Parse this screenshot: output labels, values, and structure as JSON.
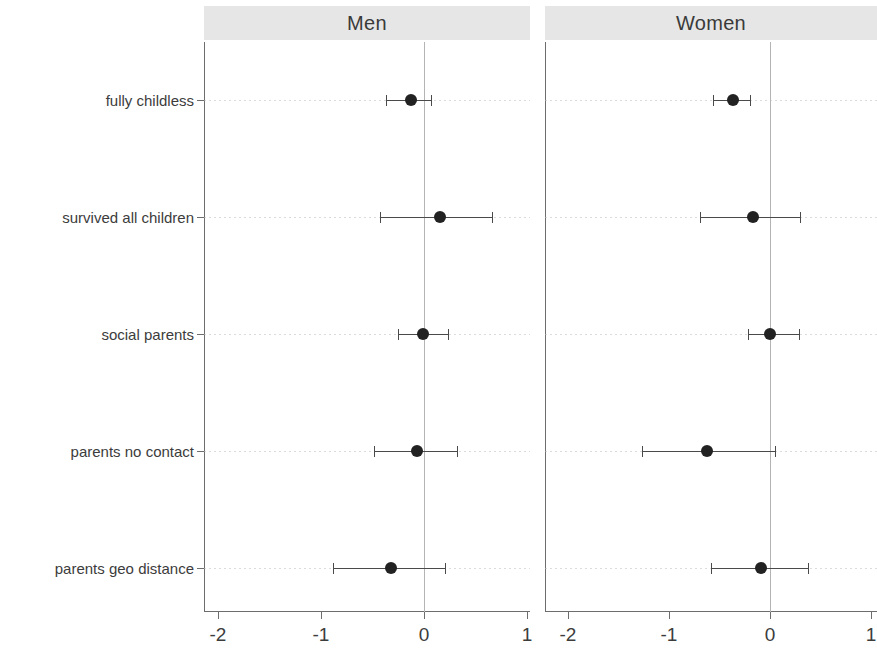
{
  "figure": {
    "width": 877,
    "height": 660,
    "background": "#ffffff",
    "strip_background": "#e6e6e6",
    "point_color": "#222222",
    "line_color": "#4a4a4a",
    "axis_color": "#6d6d6d",
    "zeroline_color": "#b4b4b4"
  },
  "chart_data": {
    "type": "scatter",
    "subtype": "forest-plot",
    "title": "",
    "subtitle": "",
    "xlabel": "",
    "ylabel": "",
    "xlim": [
      -2.3,
      1.15
    ],
    "xticks": [
      -2,
      -1,
      0,
      1
    ],
    "xticklabels": [
      "-2",
      "-1",
      "0",
      "1"
    ],
    "grid": false,
    "legend": "none",
    "reference_line": 0,
    "categories": [
      "fully childless",
      "survived all children",
      "social parents",
      "parents no contact",
      "parents geo distance"
    ],
    "panels": [
      {
        "name": "Men",
        "label": "Men",
        "points": [
          {
            "category": "fully childless",
            "estimate": -0.13,
            "ci_low": -0.37,
            "ci_high": 0.07
          },
          {
            "category": "survived all children",
            "estimate": 0.16,
            "ci_low": -0.43,
            "ci_high": 0.66
          },
          {
            "category": "social parents",
            "estimate": -0.01,
            "ci_low": -0.25,
            "ci_high": 0.23
          },
          {
            "category": "parents no contact",
            "estimate": -0.07,
            "ci_low": -0.49,
            "ci_high": 0.32
          },
          {
            "category": "parents geo distance",
            "estimate": -0.32,
            "ci_low": -0.88,
            "ci_high": 0.2
          }
        ]
      },
      {
        "name": "Women",
        "label": "Women",
        "points": [
          {
            "category": "fully childless",
            "estimate": -0.37,
            "ci_low": -0.56,
            "ci_high": -0.2
          },
          {
            "category": "survived all children",
            "estimate": -0.17,
            "ci_low": -0.69,
            "ci_high": 0.3
          },
          {
            "category": "social parents",
            "estimate": 0.0,
            "ci_low": -0.22,
            "ci_high": 0.29
          },
          {
            "category": "parents no contact",
            "estimate": -0.62,
            "ci_low": -1.27,
            "ci_high": 0.05
          },
          {
            "category": "parents geo distance",
            "estimate": -0.09,
            "ci_low": -0.58,
            "ci_high": 0.38
          }
        ]
      }
    ]
  }
}
